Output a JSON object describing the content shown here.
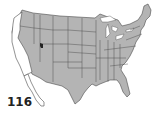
{
  "map": {
    "title": "Contiguous United States",
    "fill_color": "#b4b4b4",
    "border_color": "#4a4a4a",
    "highlight_region": "West Coast (California, coastal Oregon/Washington, Baja California)",
    "highlight_fill": "#ffffff",
    "marker": {
      "label": "Salt Lake City area",
      "color": "#222222"
    }
  },
  "figure_number": "116"
}
